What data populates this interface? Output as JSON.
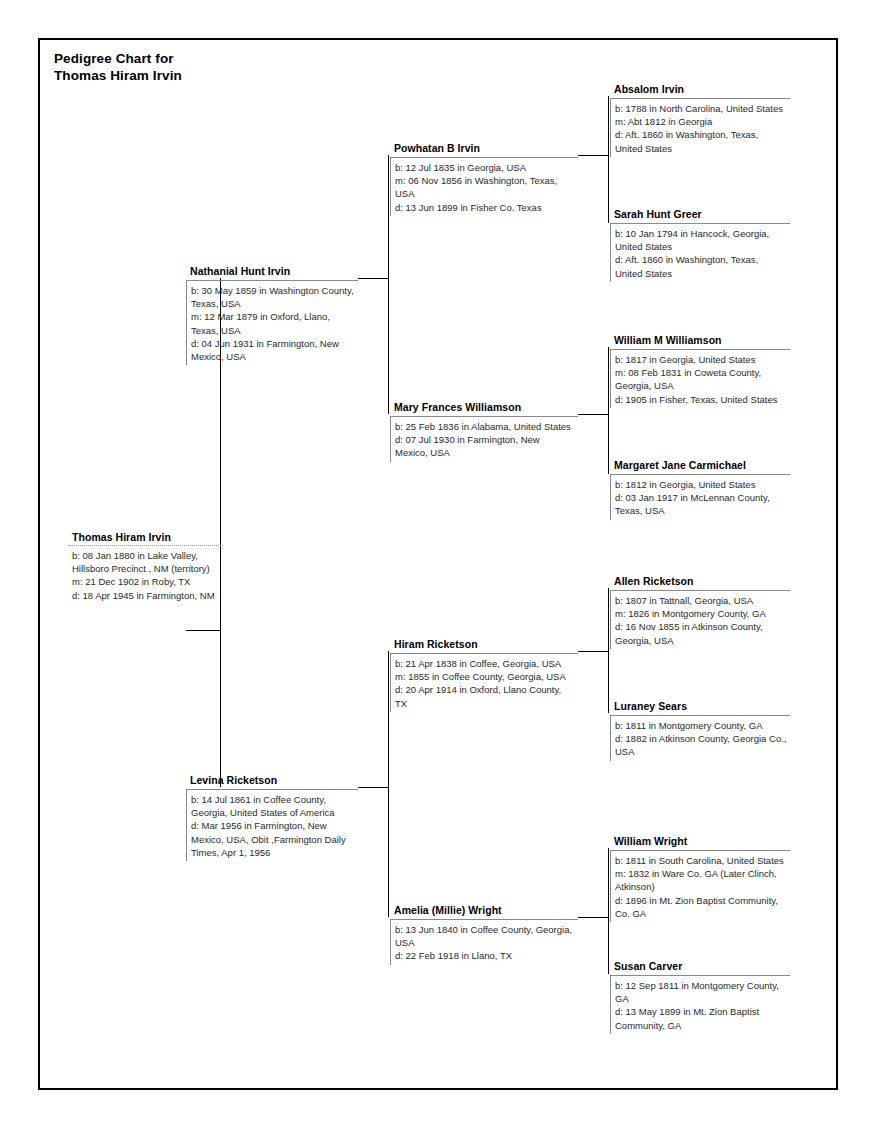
{
  "document": {
    "title_line1": "Pedigree Chart for",
    "title_line2": "Thomas Hiram Irvin",
    "title": "Pedigree Chart for\nThomas Hiram Irvin"
  },
  "people": {
    "thomas_hiram_irvin": {
      "name": "Thomas Hiram Irvin",
      "generation": 1,
      "birth": "b: 08 Jan 1880 in Lake Valley, Hillsboro Precinct , NM (territory)",
      "marriage": "m: 21 Dec 1902 in Roby, TX",
      "death": "d: 18 Apr 1945 in Farmington, NM"
    },
    "nathanial_hunt_irvin": {
      "name": "Nathanial Hunt Irvin",
      "generation": 2,
      "birth": "b: 30 May 1859 in Washington County, Texas, USA",
      "marriage": "m: 12 Mar 1879 in Oxford, Llano, Texas, USA",
      "death": "d: 04 Jun 1931 in Farmington, New Mexico, USA"
    },
    "levina_ricketson": {
      "name": "Levina Ricketson",
      "generation": 2,
      "birth": "b: 14 Jul 1861 in Coffee County, Georgia, United States of America",
      "death": "d: Mar 1956 in Farmington, New Mexico, USA, Obit ,Farmington Daily Times, Apr 1, 1956"
    },
    "powhatan_b_irvin": {
      "name": "Powhatan B Irvin",
      "generation": 3,
      "birth": "b: 12 Jul 1835 in Georgia, USA",
      "marriage": "m: 06 Nov 1856 in Washington, Texas, USA",
      "death": "d: 13 Jun 1899 in Fisher Co. Texas"
    },
    "mary_frances_williamson": {
      "name": "Mary Frances Williamson",
      "generation": 3,
      "birth": "b: 25 Feb 1836 in Alabama, United States",
      "death": "d: 07 Jul 1930 in Farmington, New Mexico, USA"
    },
    "hiram_ricketson": {
      "name": "Hiram Ricketson",
      "generation": 3,
      "birth": "b: 21 Apr 1838 in Coffee, Georgia, USA",
      "marriage": "m: 1855 in Coffee County, Georgia, USA",
      "death": "d: 20 Apr 1914 in Oxford, Llano County, TX"
    },
    "amelia_millie_wright": {
      "name": "Amelia (Millie) Wright",
      "generation": 3,
      "birth": "b: 13 Jun 1840 in Coffee County, Georgia, USA",
      "death": "d: 22 Feb 1918 in Llano, TX"
    },
    "absalom_irvin": {
      "name": "Absalom Irvin",
      "generation": 4,
      "birth": "b: 1788 in North Carolina, United States",
      "marriage": "m: Abt 1812 in Georgia",
      "death": "d: Aft. 1860 in Washington, Texas, United States"
    },
    "sarah_hunt_greer": {
      "name": "Sarah Hunt Greer",
      "generation": 4,
      "birth": "b: 10 Jan 1794 in Hancock, Georgia, United States",
      "death": "d: Aft. 1860 in Washington, Texas, United States"
    },
    "william_m_williamson": {
      "name": "William M Williamson",
      "generation": 4,
      "birth": "b: 1817 in Georgia, United States",
      "marriage": "m: 08 Feb 1831 in Coweta County, Georgia, USA",
      "death": "d: 1905 in Fisher, Texas, United States"
    },
    "margaret_jane_carmichael": {
      "name": "Margaret Jane Carmichael",
      "generation": 4,
      "birth": "b: 1812 in Georgia, United States",
      "death": "d: 03 Jan 1917 in McLennan County, Texas, USA"
    },
    "allen_ricketson": {
      "name": "Allen Ricketson",
      "generation": 4,
      "birth": "b: 1807 in Tattnall, Georgia, USA",
      "marriage": "m: 1826 in Montgomery County, GA",
      "death": "d: 16 Nov 1855 in Atkinson County, Georgia, USA"
    },
    "luraney_sears": {
      "name": "Luraney Sears",
      "generation": 4,
      "birth": "b: 1811 in Montgomery County, GA",
      "death": "d: 1882 in Atkinson County, Georgia Co., USA"
    },
    "william_wright": {
      "name": "William Wright",
      "generation": 4,
      "birth": "b: 1811 in South Carolina, United States",
      "marriage": "m: 1832 in Ware Co. GA (Later Clinch, Atkinson)",
      "death": "d: 1896 in Mt. Zion Baptist Community, Co. GA"
    },
    "susan_carver": {
      "name": "Susan Carver",
      "generation": 4,
      "birth": "b: 12 Sep 1811 in Montgomery County, GA",
      "death": "d: 13 May 1899 in Mt. Zion Baptist Community, GA"
    }
  },
  "colors": {
    "page_background": "#ffffff",
    "frame_border": "#000000",
    "box_rule": "#8a8a8a",
    "connector_line": "#000000",
    "text": "#1a1a1a",
    "name_text": "#000000"
  }
}
